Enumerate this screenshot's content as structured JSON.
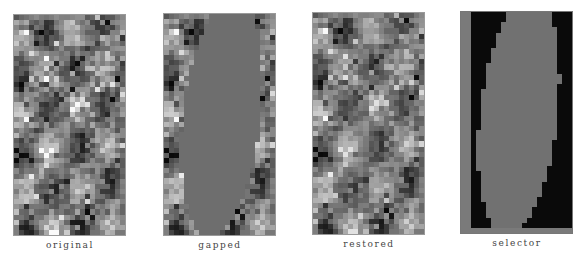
{
  "figure": {
    "panels": [
      {
        "id": "original",
        "caption": "original"
      },
      {
        "id": "gapped",
        "caption": "gapped"
      },
      {
        "id": "restored",
        "caption": "restored"
      },
      {
        "id": "selector",
        "caption": "selector"
      }
    ],
    "grid": {
      "cols": 22,
      "rows": 43
    },
    "colors": {
      "gap_fill": "#6e6e6e",
      "selector_inside": "#717171",
      "selector_outside": "#0a0a0a",
      "selector_border": "#7a7a7a",
      "caption": "#444444"
    },
    "mask_ellipse": {
      "cx": 0.52,
      "cy": 0.47,
      "rx": 0.34,
      "ry": 0.56,
      "rotate_deg": 18
    }
  }
}
